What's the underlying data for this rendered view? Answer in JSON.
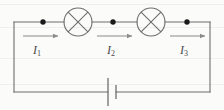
{
  "figure": {
    "type": "circuit-diagram",
    "background_color": "#fbfbfa",
    "line_color": "#6e6e6e",
    "node_color": "#1a1a1a",
    "arrow_color": "#8a8a8a",
    "label_color": "#4a4a4a"
  },
  "circuit": {
    "topology": "series-loop",
    "components": [
      {
        "id": "lamp1",
        "name": "lamp",
        "symbol": "circle-with-x",
        "cx": 78,
        "cy": 22,
        "r": 14
      },
      {
        "id": "lamp2",
        "name": "lamp",
        "symbol": "circle-with-x",
        "cx": 151,
        "cy": 22,
        "r": 14
      },
      {
        "id": "battery",
        "name": "battery",
        "symbol": "cell-long-short-plates",
        "cx": 112,
        "cy": 92
      }
    ],
    "nodes": [
      {
        "id": "node1",
        "cx": 43,
        "cy": 22
      },
      {
        "id": "node2",
        "cx": 113,
        "cy": 22
      },
      {
        "id": "node3",
        "cx": 187,
        "cy": 22
      }
    ],
    "currents": [
      {
        "id": "I1",
        "label": "I",
        "subscript": "1",
        "arrow_direction": "right",
        "arrow_x1": 23,
        "arrow_x2": 59,
        "arrow_y": 36,
        "label_x": 33,
        "label_y": 44
      },
      {
        "id": "I2",
        "label": "I",
        "subscript": "2",
        "arrow_direction": "right",
        "arrow_x1": 97,
        "arrow_x2": 133,
        "arrow_y": 36,
        "label_x": 107,
        "label_y": 44
      },
      {
        "id": "I3",
        "label": "I",
        "subscript": "3",
        "arrow_direction": "right",
        "arrow_x1": 170,
        "arrow_x2": 206,
        "arrow_y": 36,
        "label_x": 180,
        "label_y": 44
      }
    ],
    "loop_bounds": {
      "left": 14,
      "right": 210,
      "top": 22,
      "bottom": 92
    }
  },
  "scanlines": [
    {
      "y": 4
    },
    {
      "y": 27
    },
    {
      "y": 58
    },
    {
      "y": 84
    }
  ]
}
